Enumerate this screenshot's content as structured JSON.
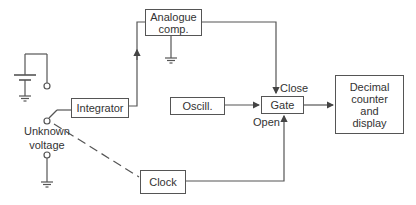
{
  "diagram": {
    "blocks": {
      "integrator": "Integrator",
      "analogue_comp_line1": "Analogue",
      "analogue_comp_line2": "comp.",
      "oscillator": "Oscill.",
      "gate": "Gate",
      "decimal_line1": "Decimal",
      "decimal_line2": "counter",
      "decimal_line3": "and",
      "decimal_line4": "display",
      "clock": "Clock"
    },
    "labels": {
      "close": "Close",
      "open": "Open",
      "unknown_line1": "Unknown",
      "unknown_line2": "voltage"
    },
    "colors": {
      "line": "#555555",
      "text": "#333333",
      "background": "#ffffff"
    }
  }
}
